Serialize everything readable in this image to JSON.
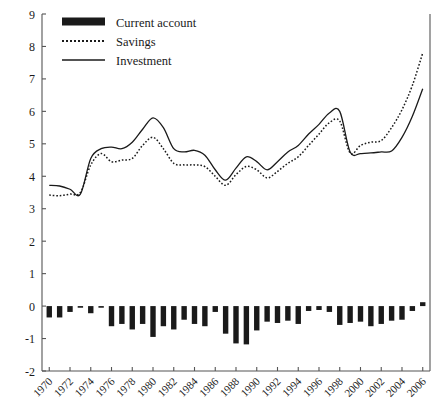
{
  "chart_data": {
    "type": "bar",
    "title": "",
    "subtitle": "",
    "xlabel": "",
    "ylabel": "",
    "xlim": [
      1969.3,
      2006.7
    ],
    "ylim": [
      -2,
      9
    ],
    "yticks": [
      -2,
      -1,
      0,
      1,
      2,
      3,
      4,
      5,
      6,
      7,
      8,
      9
    ],
    "ytick_labels": [
      "-2",
      "-1",
      "0",
      "1",
      "2",
      "3",
      "4",
      "5",
      "6",
      "7",
      "8",
      "9"
    ],
    "xticks": [
      1970,
      1972,
      1974,
      1976,
      1978,
      1980,
      1982,
      1984,
      1986,
      1988,
      1990,
      1992,
      1994,
      1996,
      1998,
      2000,
      2002,
      2004,
      2006
    ],
    "xtick_labels": [
      "1970",
      "1972",
      "1974",
      "1976",
      "1978",
      "1980",
      "1982",
      "1984",
      "1986",
      "1988",
      "1990",
      "1992",
      "1994",
      "1996",
      "1998",
      "2000",
      "2002",
      "2004",
      "2006"
    ],
    "x": [
      1970,
      1971,
      1972,
      1973,
      1974,
      1975,
      1976,
      1977,
      1978,
      1979,
      1980,
      1981,
      1982,
      1983,
      1984,
      1985,
      1986,
      1987,
      1988,
      1989,
      1990,
      1991,
      1992,
      1993,
      1994,
      1995,
      1996,
      1997,
      1998,
      1999,
      2000,
      2001,
      2002,
      2003,
      2004,
      2005,
      2006
    ],
    "grid": false,
    "legend_position": "top-left",
    "series": [
      {
        "name": "Current account",
        "type": "bar",
        "color": "#1a1a1a",
        "values": [
          -0.35,
          -0.35,
          -0.18,
          -0.05,
          -0.22,
          -0.05,
          -0.62,
          -0.55,
          -0.72,
          -0.55,
          -0.95,
          -0.62,
          -0.72,
          -0.42,
          -0.55,
          -0.62,
          -0.18,
          -0.85,
          -1.15,
          -1.18,
          -0.75,
          -0.48,
          -0.52,
          -0.45,
          -0.55,
          -0.15,
          -0.12,
          -0.18,
          -0.58,
          -0.52,
          -0.48,
          -0.62,
          -0.55,
          -0.45,
          -0.42,
          -0.15,
          0.12
        ]
      },
      {
        "name": "Savings",
        "type": "line",
        "style": "dotted",
        "color": "#1a1a1a",
        "values": [
          3.42,
          3.4,
          3.45,
          3.5,
          4.35,
          4.7,
          4.45,
          4.5,
          4.55,
          4.95,
          5.2,
          4.85,
          4.4,
          4.35,
          4.35,
          4.3,
          4.0,
          3.72,
          4.05,
          4.3,
          4.2,
          3.95,
          4.15,
          4.4,
          4.6,
          4.95,
          5.3,
          5.65,
          5.7,
          4.72,
          4.95,
          5.05,
          5.1,
          5.5,
          6.05,
          6.8,
          7.8
        ]
      },
      {
        "name": "Investment",
        "type": "line",
        "style": "solid",
        "color": "#1a1a1a",
        "values": [
          3.72,
          3.7,
          3.6,
          3.45,
          4.55,
          4.85,
          4.9,
          4.85,
          5.05,
          5.45,
          5.8,
          5.5,
          4.85,
          4.75,
          4.8,
          4.65,
          4.2,
          3.88,
          4.25,
          4.6,
          4.45,
          4.2,
          4.45,
          4.75,
          4.95,
          5.3,
          5.6,
          5.95,
          6.0,
          4.75,
          4.7,
          4.72,
          4.75,
          4.78,
          5.2,
          5.85,
          6.7
        ]
      }
    ],
    "bar_series_index": 0,
    "legend": [
      {
        "label": "Current account",
        "marker": "thick-bar"
      },
      {
        "label": "Savings",
        "marker": "dotted-line"
      },
      {
        "label": "Investment",
        "marker": "solid-line"
      }
    ]
  }
}
